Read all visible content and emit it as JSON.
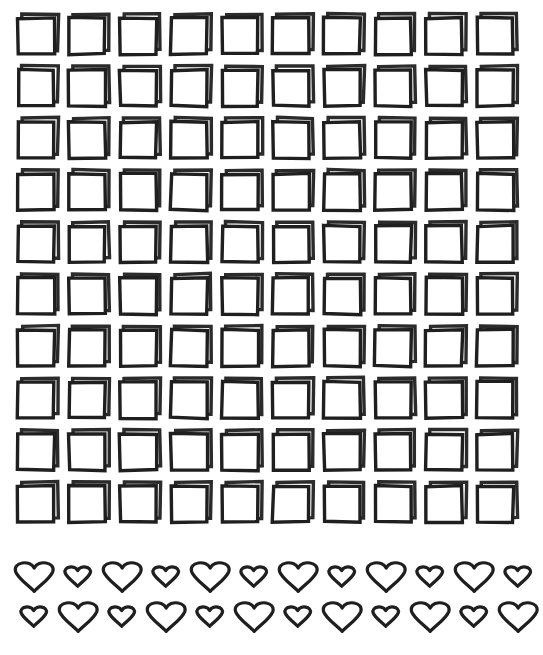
{
  "canvas": {
    "width": 543,
    "height": 655,
    "background_color": "#ffffff",
    "ink_color": "#1f1f1f",
    "shadow_color": "#2b2b2b"
  },
  "squares": {
    "name": "hand-drawn-square-outline-grid",
    "rows": 10,
    "columns": 10,
    "total_count": 100,
    "cell_size_px": 36,
    "stroke_width_px": 3.4,
    "column_pitch_px": 51,
    "row_pitch_px": 52,
    "origin_x_px": 19,
    "origin_y_px": 21,
    "style": "double-stroke offset outline, hand-drawn",
    "shadow_offset_x_px": 4,
    "shadow_offset_y_px": -4,
    "row_labels": [
      "square-row-1",
      "square-row-2",
      "square-row-3",
      "square-row-4",
      "square-row-5",
      "square-row-6",
      "square-row-7",
      "square-row-8",
      "square-row-9",
      "square-row-10"
    ]
  },
  "hearts": {
    "name": "hand-drawn-heart-outline-rows",
    "rows": 2,
    "per_row": 12,
    "total_count": 24,
    "stroke_width_px": 3.2,
    "large_size_px": 40,
    "small_size_px": 27,
    "column_pitch_px": 44,
    "row_1": {
      "label": "heart-row-1",
      "origin_x_px": 14,
      "center_y_px": 30,
      "start_size": "large",
      "sizes": [
        "large",
        "small",
        "large",
        "small",
        "large",
        "small",
        "large",
        "small",
        "large",
        "small",
        "large",
        "small"
      ]
    },
    "row_2": {
      "label": "heart-row-2",
      "origin_x_px": 14,
      "center_y_px": 70,
      "start_size": "small",
      "sizes": [
        "small",
        "large",
        "small",
        "large",
        "small",
        "large",
        "small",
        "large",
        "small",
        "large",
        "small",
        "large"
      ]
    }
  }
}
